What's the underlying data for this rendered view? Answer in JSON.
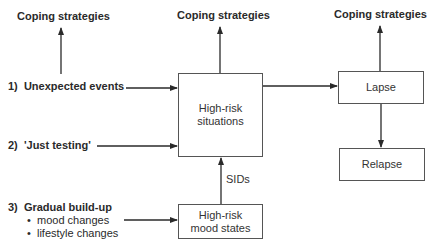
{
  "diagram": {
    "coping_labels": [
      "Coping strategies",
      "Coping strategies",
      "Coping strategies"
    ],
    "triggers": [
      {
        "number": "1)",
        "label": "Unexpected events"
      },
      {
        "number": "2)",
        "label": "'Just testing'"
      },
      {
        "number": "3)",
        "label": "Gradual build-up",
        "bullets": [
          "mood changes",
          "lifestyle changes"
        ]
      }
    ],
    "boxes": {
      "high_risk_situations": "High-risk situations",
      "high_risk_mood_states": "High-risk mood states",
      "lapse": "Lapse",
      "relapse": "Relapse"
    },
    "edge_labels": {
      "sids": "SIDs"
    },
    "colors": {
      "line": "#2a2a2a",
      "box_border": "#555555",
      "text": "#2a2a2a"
    }
  }
}
